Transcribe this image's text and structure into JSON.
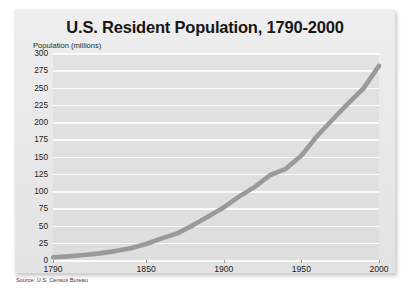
{
  "chart_data": {
    "type": "line",
    "title": "U.S. Resident Population, 1790-2000",
    "ylabel": "Population (millions)",
    "xlabel": "",
    "source": "Source: U.S. Census Bureau",
    "xlim": [
      1790,
      2000
    ],
    "ylim": [
      0,
      300
    ],
    "grid": true,
    "legend": "none",
    "line_color": "#9a9a9a",
    "plot_background": "#e0e0e0",
    "gridline_color": "#fbfbfb",
    "yticks": [
      300,
      275,
      250,
      225,
      200,
      175,
      150,
      125,
      100,
      75,
      50,
      25,
      0
    ],
    "xticks": [
      1790,
      1850,
      1900,
      1950,
      2000
    ],
    "x": [
      1790,
      1800,
      1810,
      1820,
      1830,
      1840,
      1850,
      1860,
      1870,
      1880,
      1890,
      1900,
      1910,
      1920,
      1930,
      1940,
      1950,
      1960,
      1970,
      1980,
      1990,
      2000
    ],
    "values": [
      3.9,
      5.3,
      7.2,
      9.6,
      12.9,
      17.1,
      23.2,
      31.4,
      38.6,
      50.2,
      62.9,
      76.2,
      92.2,
      106.0,
      123.2,
      132.2,
      151.3,
      179.3,
      203.3,
      226.5,
      248.7,
      281.4
    ]
  }
}
